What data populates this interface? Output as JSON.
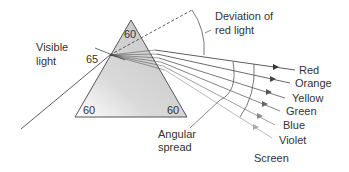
{
  "diagram": {
    "labels": {
      "visible_light_1": "Visible",
      "visible_light_2": "light",
      "incidence_angle": "65",
      "apex_angle": "60",
      "base_left_angle": "60",
      "base_right_angle": "60",
      "deviation_1": "Deviation of",
      "deviation_2": "red light",
      "angular_spread_1": "Angular",
      "angular_spread_2": "spread",
      "screen": "Screen"
    },
    "colors_out": [
      "Red",
      "Orange",
      "Yellow",
      "Green",
      "Blue",
      "Violet"
    ],
    "style": {
      "prism_fill": "#c8c8c8",
      "line_color": "#333333",
      "ray_gray": "#aaaaaa"
    }
  }
}
